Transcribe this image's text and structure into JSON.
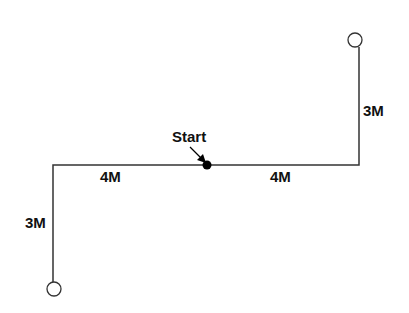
{
  "diagram": {
    "start_label": "Start",
    "segments": [
      {
        "id": "left-vertical",
        "label": "3M"
      },
      {
        "id": "left-horizontal",
        "label": "4M"
      },
      {
        "id": "right-horizontal",
        "label": "4M"
      },
      {
        "id": "right-vertical",
        "label": "3M"
      }
    ],
    "colors": {
      "line": "#333333",
      "start_dot": "#000000",
      "text": "#111111"
    }
  }
}
